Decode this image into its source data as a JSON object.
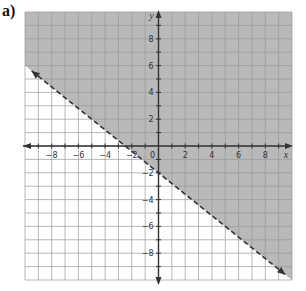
{
  "part_label": "a)",
  "chart_data": {
    "type": "line",
    "title": "",
    "xlabel": "x",
    "ylabel": "y",
    "xlim": [
      -10,
      10
    ],
    "ylim": [
      -10,
      10
    ],
    "grid": true,
    "x_ticks": [
      -8,
      -6,
      -4,
      -2,
      0,
      2,
      4,
      6,
      8
    ],
    "y_ticks": [
      8,
      6,
      4,
      2,
      -2,
      -4,
      -6,
      -8
    ],
    "tick_labels": {
      "x": [
        "−8",
        "−6",
        "−4",
        "−2",
        "0",
        "2",
        "4",
        "6",
        "8"
      ],
      "y": [
        "8",
        "6",
        "4",
        "2",
        "−2",
        "−4",
        "−6",
        "−8"
      ]
    },
    "boundary_line": {
      "equation": "y = -0.8x - 2",
      "slope": -0.8,
      "intercept": -2,
      "style": "dashed",
      "endpoints": [
        [
          -9.5,
          5.6
        ],
        [
          9.5,
          -9.6
        ]
      ]
    },
    "shaded_region": "above line (y > -0.8x - 2)",
    "colors": {
      "shade": "#b9b9b9",
      "grid": "#9a9a9a",
      "axis": "#333333",
      "line": "#333333"
    }
  }
}
